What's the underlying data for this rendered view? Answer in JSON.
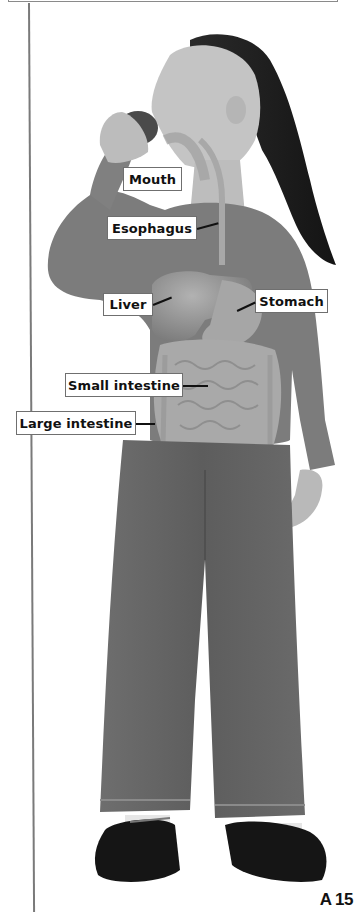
{
  "figure": {
    "labels": [
      {
        "id": "mouth",
        "text": "Mouth"
      },
      {
        "id": "esophagus",
        "text": "Esophagus"
      },
      {
        "id": "liver",
        "text": "Liver"
      },
      {
        "id": "stomach",
        "text": "Stomach"
      },
      {
        "id": "small-intestine",
        "text": "Small intestine"
      },
      {
        "id": "large-intestine",
        "text": "Large intestine"
      }
    ]
  },
  "page": {
    "number": "A 15"
  },
  "colors": {
    "label_border": "#6f6f6f",
    "rule": "#7a7a7a",
    "shirt": "#7c7c7c",
    "jeans": "#6a6a6a",
    "hair": "#1c1c1c",
    "skin": "#b9b9b9",
    "organs": "#9a9a9a"
  }
}
